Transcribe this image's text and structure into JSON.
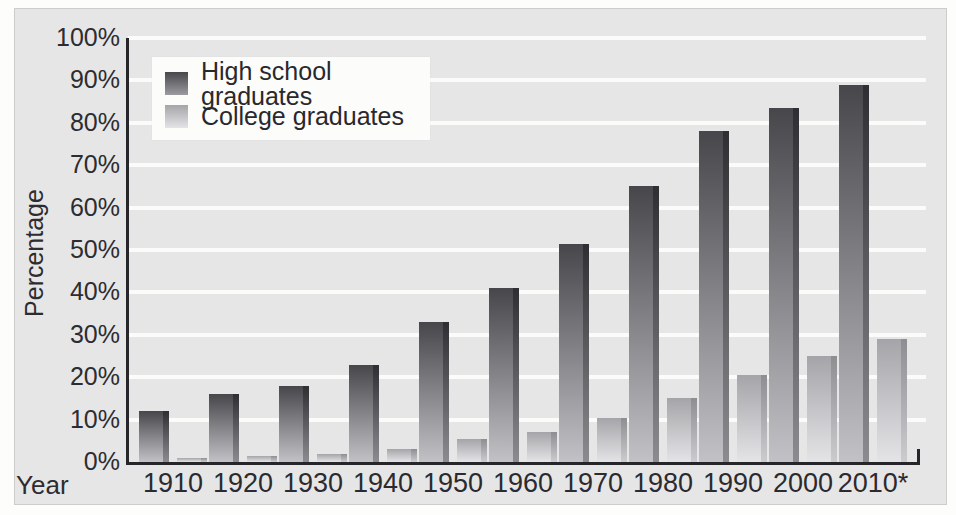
{
  "figure": {
    "ylabel": "Percentage",
    "xlabel": "Year",
    "legend": [
      {
        "label": "High school graduates",
        "swatch": "dark-gradient-square"
      },
      {
        "label": "College graduates",
        "swatch": "light-gradient-square"
      }
    ]
  },
  "chart_data": {
    "type": "bar",
    "title": "",
    "xlabel": "Year",
    "ylabel": "Percentage",
    "ylim": [
      0,
      100
    ],
    "ytick_step": 10,
    "ytick_labels": [
      "0%",
      "10%",
      "20%",
      "30%",
      "40%",
      "50%",
      "60%",
      "70%",
      "80%",
      "90%",
      "100%"
    ],
    "categories": [
      "1910",
      "1920",
      "1930",
      "1940",
      "1950",
      "1960",
      "1970",
      "1980",
      "1990",
      "2000",
      "2010*"
    ],
    "series": [
      {
        "name": "High school graduates",
        "values": [
          12,
          16,
          18,
          23,
          33,
          41,
          51.5,
          65,
          78,
          83.5,
          89
        ]
      },
      {
        "name": "College graduates",
        "values": [
          1,
          1.5,
          2,
          3,
          5.5,
          7,
          10.5,
          15,
          20.5,
          25,
          29
        ]
      }
    ],
    "grid": "horizontal-white-lines",
    "legend_position": "upper-left"
  },
  "colors": {
    "figure_background": "#e7e6e6",
    "gridline": "#fbfbfa",
    "axis": "#26262a",
    "text": "#2d2c30",
    "legend_background": "#fcfcfb",
    "high_school_bar_top": "#46464b",
    "high_school_bar_bottom": "#c2c2c6",
    "high_school_edge_top": "#2e2e33",
    "high_school_edge_bottom": "#8b8b90",
    "college_bar_top": "#a5a5a9",
    "college_bar_bottom": "#e4e4e7",
    "college_edge_top": "#8d8d92",
    "college_edge_bottom": "#cccccf"
  }
}
